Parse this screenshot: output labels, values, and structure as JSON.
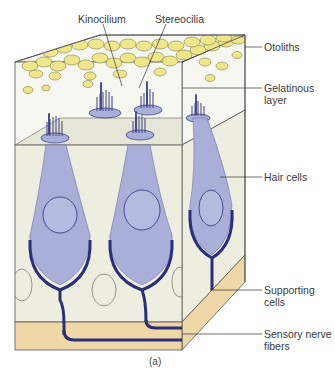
{
  "figure": {
    "caption": "(a)",
    "colors": {
      "otolith_fill": "#efe68a",
      "otolith_stroke": "#6b6a3a",
      "gel_fill": "#f7f7f2",
      "tissue_fill": "#eeeee0",
      "hair_cell_fill": "#a9afd8",
      "nerve_stroke": "#2a2f78",
      "basement_fill": "#efd7a8",
      "label_line": "#333333"
    }
  },
  "labels": {
    "kinocilium": "Kinocilium",
    "stereocilia": "Stereocilia",
    "otoliths": "Otoliths",
    "gelatinous_layer": "Gelatinous layer",
    "hair_cells": "Hair cells",
    "supporting_cells": "Supporting cells",
    "sensory_nerve_fibers": "Sensory nerve fibers"
  }
}
